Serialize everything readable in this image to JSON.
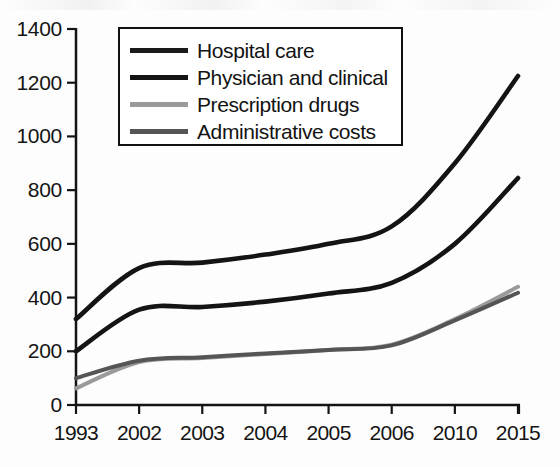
{
  "chart_data": {
    "type": "line",
    "title": "",
    "subtitle": "",
    "xlabel": "",
    "ylabel": "",
    "categories": [
      "1993",
      "2002",
      "2003",
      "2004",
      "2005",
      "2006",
      "2010",
      "2015"
    ],
    "ylim": [
      0,
      1400
    ],
    "ytick_values": [
      0,
      200,
      400,
      600,
      800,
      1000,
      1200,
      1400
    ],
    "ytick_labels": [
      "0",
      "200",
      "400",
      "600",
      "800",
      "1000",
      "1200",
      "1400"
    ],
    "grid": false,
    "legend_position": "top-left",
    "series": [
      {
        "name": "Hospital care",
        "color": "#141414",
        "values": [
          320,
          510,
          530,
          560,
          600,
          665,
          900,
          1225
        ]
      },
      {
        "name": "Physician and clinical",
        "color": "#141414",
        "values": [
          200,
          355,
          365,
          385,
          415,
          455,
          600,
          845
        ]
      },
      {
        "name": "Prescription drugs",
        "color": "#9a9a9a",
        "values": [
          62,
          160,
          175,
          190,
          205,
          225,
          320,
          440
        ]
      },
      {
        "name": "Administrative costs",
        "color": "#555555",
        "values": [
          100,
          165,
          178,
          192,
          205,
          222,
          315,
          418
        ]
      }
    ]
  },
  "axes": {
    "axis_color": "#141414",
    "tick_length": 9,
    "axis_width": 2.5
  },
  "legend": {
    "entries": [
      {
        "label": "Hospital care",
        "color": "#1a1a1a",
        "thickness": 5
      },
      {
        "label": "Physician and clinical",
        "color": "#141414",
        "thickness": 5.5
      },
      {
        "label": "Prescription drugs",
        "color": "#9a9a9a",
        "thickness": 4.5
      },
      {
        "label": "Administrative costs",
        "color": "#555555",
        "thickness": 5
      }
    ]
  }
}
